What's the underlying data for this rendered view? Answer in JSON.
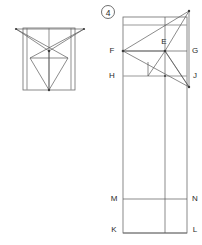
{
  "sheet": {
    "width": 202,
    "height": 245,
    "background": "#ffffff",
    "title": "Geometric construction figure 4",
    "colors": {
      "line": "#5a5a5a",
      "guide": "#9a9a9a",
      "frame": "#6b6b6b",
      "vertex": "#3c3c3c",
      "label": "#2a2a2a"
    }
  },
  "badge": {
    "name": "figure-number",
    "text": "4",
    "cx": 108,
    "cy": 12,
    "r": 6.5
  },
  "left_figure": {
    "name": "left-net-diagram",
    "frame": {
      "x": 23,
      "y": 28,
      "width": 52,
      "height": 62
    },
    "guides": [
      {
        "name": "guide-vertical-left",
        "x1": 27,
        "y1": 28,
        "x2": 27,
        "y2": 90
      },
      {
        "name": "guide-vertical-center",
        "x1": 49,
        "y1": 28,
        "x2": 49,
        "y2": 90
      },
      {
        "name": "guide-vertical-right",
        "x1": 71,
        "y1": 28,
        "x2": 71,
        "y2": 90
      }
    ],
    "points": [
      {
        "id": "TL",
        "x": 16,
        "y": 29
      },
      {
        "id": "TR",
        "x": 84,
        "y": 29
      },
      {
        "id": "C",
        "x": 49,
        "y": 51
      },
      {
        "id": "BL",
        "x": 30,
        "y": 58
      },
      {
        "id": "BR",
        "x": 68,
        "y": 58
      },
      {
        "id": "AP",
        "x": 49,
        "y": 90
      }
    ],
    "edges": [
      {
        "name": "edge-tl-tr",
        "from": "TL",
        "to": "TR"
      },
      {
        "name": "edge-tl-c",
        "from": "TL",
        "to": "C"
      },
      {
        "name": "edge-tr-c",
        "from": "TR",
        "to": "C"
      },
      {
        "name": "edge-tl-br",
        "from": "TL",
        "to": "BR"
      },
      {
        "name": "edge-tr-bl",
        "from": "TR",
        "to": "BL"
      },
      {
        "name": "edge-bl-br",
        "from": "BL",
        "to": "BR"
      },
      {
        "name": "edge-bl-ap",
        "from": "BL",
        "to": "AP"
      },
      {
        "name": "edge-br-ap",
        "from": "BR",
        "to": "AP"
      },
      {
        "name": "edge-c-ap",
        "from": "C",
        "to": "AP"
      }
    ]
  },
  "right_figure": {
    "name": "right-net-diagram",
    "frame": {
      "x": 123,
      "y": 17,
      "width": 64,
      "height": 220
    },
    "points": [
      {
        "id": "F",
        "x": 123,
        "y": 51,
        "label": "F",
        "label_side": "left"
      },
      {
        "id": "G",
        "x": 187,
        "y": 51,
        "label": "G",
        "label_side": "right"
      },
      {
        "id": "H",
        "x": 123,
        "y": 76,
        "label": "H",
        "label_side": "left"
      },
      {
        "id": "J",
        "x": 187,
        "y": 76,
        "label": "J",
        "label_side": "right"
      },
      {
        "id": "E",
        "x": 165,
        "y": 51,
        "label": "E",
        "label_side": "above"
      },
      {
        "id": "M",
        "x": 123,
        "y": 199,
        "label": "M",
        "label_side": "left"
      },
      {
        "id": "N",
        "x": 187,
        "y": 199,
        "label": "N",
        "label_side": "right"
      },
      {
        "id": "K",
        "x": 123,
        "y": 233,
        "label": "K",
        "label_side": "left"
      },
      {
        "id": "L",
        "x": 187,
        "y": 233,
        "label": "L",
        "label_side": "right"
      },
      {
        "id": "T",
        "x": 189,
        "y": 11,
        "label": "",
        "label_side": "none"
      },
      {
        "id": "B",
        "x": 189,
        "y": 87,
        "label": "",
        "label_side": "none"
      }
    ],
    "guides": [
      {
        "name": "guide-top-edge",
        "x1": 123,
        "y1": 25,
        "x2": 187,
        "y2": 25
      },
      {
        "name": "guide-line-fg",
        "x1": 123,
        "y1": 51,
        "x2": 187,
        "y2": 51
      },
      {
        "name": "guide-line-hj",
        "x1": 123,
        "y1": 76,
        "x2": 187,
        "y2": 76
      },
      {
        "name": "guide-line-mn",
        "x1": 123,
        "y1": 199,
        "x2": 187,
        "y2": 199
      },
      {
        "name": "guide-vert-center",
        "x1": 165,
        "y1": 17,
        "x2": 165,
        "y2": 233
      },
      {
        "name": "guide-vert-left",
        "x1": 123,
        "y1": 17,
        "x2": 123,
        "y2": 233
      },
      {
        "name": "guide-vert-right",
        "x1": 187,
        "y1": 17,
        "x2": 187,
        "y2": 233
      },
      {
        "name": "guide-bottom-edge",
        "x1": 123,
        "y1": 233,
        "x2": 187,
        "y2": 233
      }
    ],
    "edges": [
      {
        "name": "edge-f-apex",
        "from": "F",
        "to": "T"
      },
      {
        "name": "edge-apex-e",
        "from": "T",
        "to": "E"
      },
      {
        "name": "edge-apex-low",
        "from": "T",
        "to": "B"
      },
      {
        "name": "edge-f-low",
        "from": "F",
        "to": "B"
      },
      {
        "name": "edge-f-e",
        "from": "F",
        "to": "E"
      },
      {
        "name": "edge-e-low",
        "from": "E",
        "to": "B"
      },
      {
        "name": "edge-e-down",
        "from": "E",
        "to": "KD"
      }
    ],
    "vertex_dots": [
      {
        "name": "vertex-f",
        "x": 123,
        "y": 51
      },
      {
        "name": "vertex-e",
        "x": 165,
        "y": 51
      },
      {
        "name": "vertex-apex",
        "x": 189,
        "y": 11
      },
      {
        "name": "vertex-low",
        "x": 189,
        "y": 87
      },
      {
        "name": "vertex-j-cross",
        "x": 165,
        "y": 76
      }
    ]
  },
  "labels": {
    "E": "E",
    "F": "F",
    "G": "G",
    "H": "H",
    "J": "J",
    "K": "K",
    "L": "L",
    "M": "M",
    "N": "N",
    "figure_number": "4"
  }
}
